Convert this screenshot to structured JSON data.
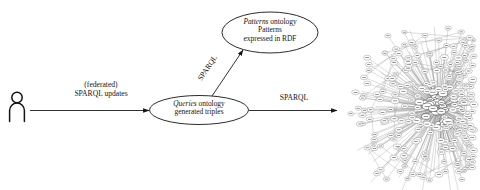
{
  "figure": {
    "type": "architecture-flow-diagram",
    "background_color": "#ffffff",
    "line_color": "#141414"
  },
  "actor": {
    "icon": "person-icon",
    "label": ""
  },
  "edges": [
    {
      "id": "user-to-queries",
      "line1": "(federated)",
      "line2": "SPARQL updates",
      "from": "person-icon",
      "to": "queries-ontology-node",
      "direction": "right"
    },
    {
      "id": "queries-to-patterns",
      "label": "SPARQL",
      "from": "queries-ontology-node",
      "to": "patterns-ontology-node",
      "direction": "up-right",
      "rotation_deg": -56
    },
    {
      "id": "queries-to-graph",
      "label": "SPARQL",
      "from": "queries-ontology-node",
      "to": "rdf-graph-visualization",
      "direction": "right"
    }
  ],
  "nodes": {
    "patterns": {
      "id": "patterns-ontology-node",
      "line1_italic": "Patterns",
      "line1_rest": "ontology",
      "line2": "Patterns",
      "line3": "expressed in RDF"
    },
    "queries": {
      "id": "queries-ontology-node",
      "line1_italic": "Queries",
      "line1_rest": "ontology",
      "line2": "generated triples"
    }
  },
  "graph": {
    "id": "rdf-graph-visualization",
    "description": "dense radial node-link RDF graph",
    "node_fill": "#ffffff",
    "node_stroke": "#6e6e6e",
    "edge_stroke": "#8c8c8c"
  }
}
